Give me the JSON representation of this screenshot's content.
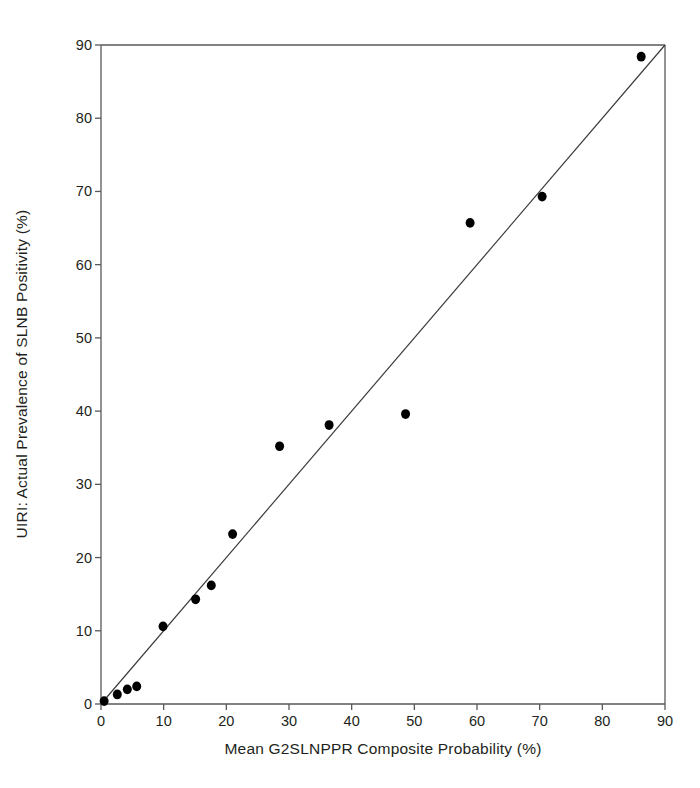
{
  "chart_data": {
    "type": "scatter",
    "title": "",
    "subtitle": "",
    "xlabel": "Mean G2SLNPPR Composite Probability (%)",
    "ylabel": "UIRI: Actual Prevalence of SLNB Positivity (%)",
    "xlim": [
      0,
      90
    ],
    "ylim": [
      0,
      90
    ],
    "xticks": [
      0,
      10,
      20,
      30,
      40,
      50,
      60,
      70,
      80,
      90
    ],
    "yticks": [
      0,
      10,
      20,
      30,
      40,
      50,
      60,
      70,
      80,
      90
    ],
    "xtick_labels": [
      "0",
      "10",
      "20",
      "30",
      "40",
      "50",
      "60",
      "70",
      "80",
      "90"
    ],
    "ytick_labels": [
      "0",
      "10",
      "20",
      "30",
      "40",
      "50",
      "60",
      "70",
      "80",
      "90"
    ],
    "grid": false,
    "legend": false,
    "legend_position": "none",
    "marker": "filled-circle",
    "marker_color": "#000000",
    "marker_size_px": 9,
    "axis_color": "#58595b",
    "background_color": "#ffffff",
    "reference_line": {
      "name": "identity-line",
      "type": "line",
      "from": [
        0,
        0
      ],
      "to": [
        90,
        90
      ],
      "color": "#3b3b3b",
      "width_px": 1.2,
      "description": "y = x perfect-calibration diagonal"
    },
    "series": [
      {
        "name": "Calibration points",
        "points": [
          {
            "x": 0.5,
            "y": 0.4
          },
          {
            "x": 2.6,
            "y": 1.3
          },
          {
            "x": 4.2,
            "y": 2.0
          },
          {
            "x": 5.7,
            "y": 2.4
          },
          {
            "x": 9.9,
            "y": 10.6
          },
          {
            "x": 15.1,
            "y": 14.3
          },
          {
            "x": 17.6,
            "y": 16.2
          },
          {
            "x": 21.0,
            "y": 23.2
          },
          {
            "x": 28.5,
            "y": 35.2
          },
          {
            "x": 36.4,
            "y": 38.1
          },
          {
            "x": 48.6,
            "y": 39.6
          },
          {
            "x": 58.9,
            "y": 65.7
          },
          {
            "x": 70.4,
            "y": 69.3
          },
          {
            "x": 86.2,
            "y": 88.4
          }
        ]
      }
    ]
  },
  "axes": {
    "x_title": "Mean G2SLNPPR Composite Probability (%)",
    "y_title": "UIRI: Actual Prevalence of SLNB Positivity (%)"
  }
}
